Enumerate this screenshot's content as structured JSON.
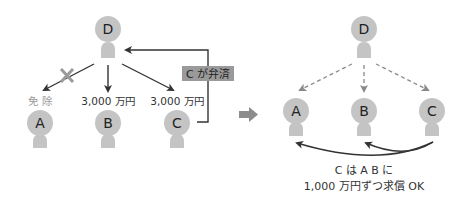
{
  "colors": {
    "figure": "#c4c4c4",
    "line": "#333333",
    "dashed": "#8a8a8a",
    "label_box": "#9a9a9a",
    "muted_text": "#9a9a9a",
    "text": "#333333",
    "cross": "#9a9a9a",
    "transition_arrow": "#8c8c8c"
  },
  "left_panel": {
    "creditor": {
      "letter": "D"
    },
    "debtors": [
      {
        "letter": "A",
        "amount_label": "免 除",
        "status": "exempted"
      },
      {
        "letter": "B",
        "amount_label": "3,000 万円"
      },
      {
        "letter": "C",
        "amount_label": "3,000 万円"
      }
    ],
    "repayment_label": "C が弁済"
  },
  "right_panel": {
    "creditor": {
      "letter": "D"
    },
    "debtors": [
      {
        "letter": "A"
      },
      {
        "letter": "B"
      },
      {
        "letter": "C"
      }
    ],
    "caption_line1": "C は A B に",
    "caption_line2": "1,000 万円ずつ求償 OK"
  }
}
